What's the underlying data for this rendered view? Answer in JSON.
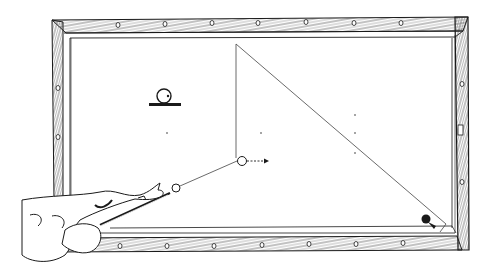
{
  "diagram": {
    "colors": {
      "ink": "#1a1a1a",
      "background": "#ffffff",
      "rail_fill": "#ffffff"
    },
    "table": {
      "outer": {
        "x1": 52,
        "y1": 20,
        "x2": 468,
        "y2": 250
      },
      "inner": {
        "x1": 70,
        "y1": 35,
        "x2": 453,
        "y2": 237
      },
      "diamonds_top_x": [
        118,
        165,
        212,
        280,
        327,
        374,
        421
      ],
      "diamonds_bottom_x": [
        120,
        167,
        214,
        262,
        309,
        356,
        403
      ],
      "diamonds_left_y": [
        88,
        137
      ],
      "diamonds_right_y": [
        82,
        182
      ]
    },
    "balls": {
      "cue_ball": {
        "x": 176,
        "y": 188,
        "r": 4
      },
      "object_ball": {
        "x": 242,
        "y": 161,
        "r": 4.5
      },
      "pocket_ball": {
        "x": 426,
        "y": 219,
        "r": 4.5,
        "filled": true
      }
    },
    "paths": {
      "aim_line": [
        [
          176,
          188
        ],
        [
          236,
          163
        ],
        [
          236,
          44
        ],
        [
          446,
          224
        ]
      ],
      "deflect_arrow": [
        [
          247,
          161
        ],
        [
          268,
          161
        ]
      ]
    },
    "spin_symbol": {
      "x": 166,
      "y": 96,
      "r": 7,
      "base_y": 104
    },
    "spots": [
      [
        167,
        133
      ],
      [
        261,
        133
      ],
      [
        355,
        115
      ],
      [
        355,
        133
      ],
      [
        167,
        154
      ],
      [
        355,
        154
      ]
    ],
    "caption": ""
  }
}
